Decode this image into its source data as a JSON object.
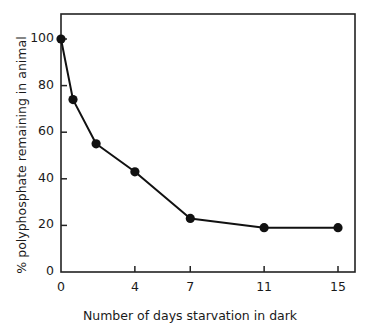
{
  "chart_data": {
    "type": "line",
    "title": "",
    "xlabel": "Number of days starvation in dark",
    "ylabel": "% polyphosphate remaining in animal",
    "xlim": [
      0,
      16
    ],
    "ylim": [
      0,
      110
    ],
    "grid": false,
    "legend": "none",
    "marker": "filled-circle",
    "line_color": "#111111",
    "marker_color": "#111111",
    "background": "#ffffff",
    "frame": "box",
    "xticks": [
      0,
      4,
      7,
      11,
      15
    ],
    "xtick_labels": [
      "0",
      "4",
      "7",
      "11",
      "15"
    ],
    "yticks": [
      0,
      20,
      40,
      60,
      80,
      100
    ],
    "ytick_labels": [
      "0",
      "20",
      "40",
      "60",
      "80",
      "100"
    ],
    "x": [
      0,
      0.65,
      1.9,
      4,
      7,
      11,
      15
    ],
    "values": [
      100,
      74,
      55,
      43,
      23,
      19,
      19
    ],
    "series": [
      {
        "name": "polyphosphate remaining",
        "points": [
          {
            "x": 0,
            "y": 100
          },
          {
            "x": 0.65,
            "y": 74
          },
          {
            "x": 1.9,
            "y": 55
          },
          {
            "x": 4,
            "y": 43
          },
          {
            "x": 7,
            "y": 23
          },
          {
            "x": 11,
            "y": 19
          },
          {
            "x": 15,
            "y": 19
          }
        ]
      }
    ]
  }
}
